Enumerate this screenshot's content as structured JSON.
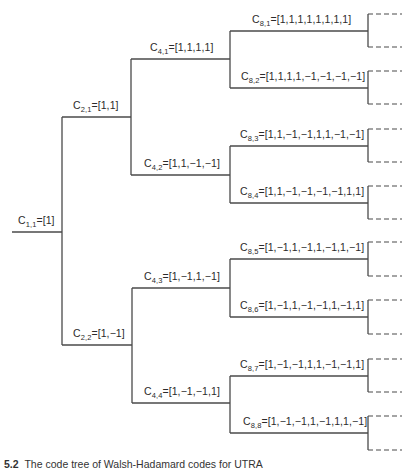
{
  "figure": {
    "type": "OVSF code tree",
    "caption_partial": "The code tree of Walsh-Hadamard codes for UTRA",
    "caption_number": "5.2",
    "line_color": "#4a4a4a"
  },
  "nodes": [
    {
      "id": "C1,1",
      "base": "C",
      "sub": "1,1",
      "code": "[1]"
    },
    {
      "id": "C2,1",
      "base": "C",
      "sub": "2,1",
      "code": "[1,1]"
    },
    {
      "id": "C2,2",
      "base": "C",
      "sub": "2,2",
      "code": "[1,−1]"
    },
    {
      "id": "C4,1",
      "base": "C",
      "sub": "4,1",
      "code": "[1,1,1,1]"
    },
    {
      "id": "C4,2",
      "base": "C",
      "sub": "4,2",
      "code": "[1,1,−1,−1]"
    },
    {
      "id": "C4,3",
      "base": "C",
      "sub": "4,3",
      "code": "[1,−1,1,−1]"
    },
    {
      "id": "C4,4",
      "base": "C",
      "sub": "4,4",
      "code": "[1,−1,−1,1]"
    },
    {
      "id": "C8,1",
      "base": "C",
      "sub": "8,1",
      "code": "[1,1,1,1,1,1,1,1]"
    },
    {
      "id": "C8,2",
      "base": "C",
      "sub": "8,2",
      "code": "[1,1,1,1,−1,−1,−1,−1]"
    },
    {
      "id": "C8,3",
      "base": "C",
      "sub": "8,3",
      "code": "[1,1,−1,−1,1,1,−1,−1]"
    },
    {
      "id": "C8,4",
      "base": "C",
      "sub": "8,4",
      "code": "[1,1,−1,−1,−1,−1,1,1]"
    },
    {
      "id": "C8,5",
      "base": "C",
      "sub": "8,5",
      "code": "[1,−1,1,−1,1,−1,1,−1]"
    },
    {
      "id": "C8,6",
      "base": "C",
      "sub": "8,6",
      "code": "[1,−1,1,−1,−1,1,−1,1]"
    },
    {
      "id": "C8,7",
      "base": "C",
      "sub": "8,7",
      "code": "[1,−1,−1,1,1,−1,−1,1]"
    },
    {
      "id": "C8,8",
      "base": "C",
      "sub": "8,8",
      "code": "[1,−1,−1,1,−1,1,1,−1]"
    }
  ]
}
